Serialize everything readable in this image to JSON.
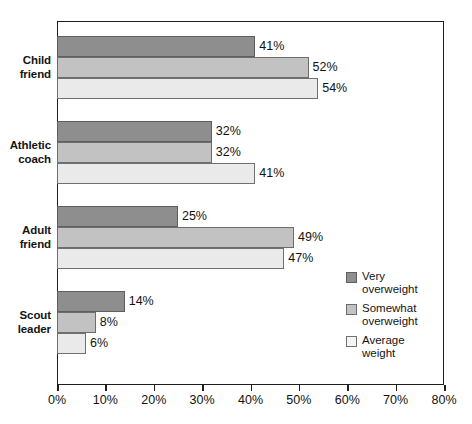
{
  "title": {
    "text": "",
    "cropped": true
  },
  "chart_data": {
    "type": "bar",
    "orientation": "horizontal",
    "title": "",
    "xlabel": "",
    "ylabel": "",
    "xlim": [
      0,
      80
    ],
    "xtick_labels": [
      "0%",
      "10%",
      "20%",
      "30%",
      "40%",
      "50%",
      "60%",
      "70%",
      "80%"
    ],
    "xticks": [
      0,
      10,
      20,
      30,
      40,
      50,
      60,
      70,
      80
    ],
    "grid": false,
    "legend_position": "inside-right",
    "value_suffix": "%",
    "categories": [
      "Child friend",
      "Athletic coach",
      "Adult friend",
      "Scout leader"
    ],
    "category_lines": [
      [
        "Child",
        "friend"
      ],
      [
        "Athletic",
        "coach"
      ],
      [
        "Adult",
        "friend"
      ],
      [
        "Scout",
        "leader"
      ]
    ],
    "series": [
      {
        "name": "Very overweight",
        "name_lines": [
          "Very",
          "overweight"
        ],
        "color": "#8e8e8e",
        "values": [
          41,
          32,
          25,
          14
        ],
        "labels": [
          "41%",
          "32%",
          "25%",
          "14%"
        ]
      },
      {
        "name": "Somewhat overweight",
        "name_lines": [
          "Somewhat",
          "overweight"
        ],
        "color": "#c2c2c2",
        "values": [
          52,
          32,
          49,
          8
        ],
        "labels": [
          "52%",
          "32%",
          "49%",
          "8%"
        ]
      },
      {
        "name": "Average weight",
        "name_lines": [
          "Average",
          "weight"
        ],
        "color": "#f4f4f4",
        "values": [
          54,
          41,
          47,
          6
        ],
        "labels": [
          "54%",
          "41%",
          "47%",
          "6%"
        ]
      }
    ]
  }
}
